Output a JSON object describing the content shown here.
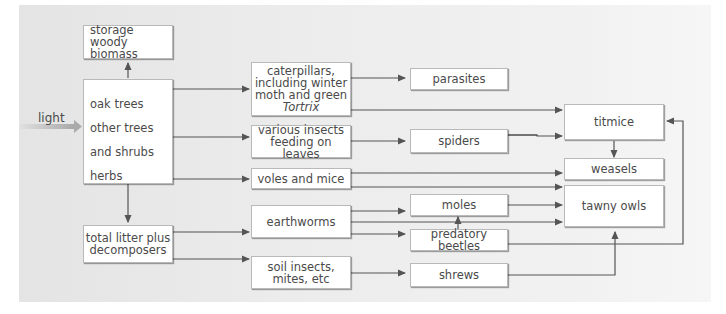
{
  "diagram": {
    "type": "food web flow diagram",
    "input_label": "light",
    "nodes": {
      "storage": [
        "storage",
        "woody biomass"
      ],
      "producers": [
        "oak trees",
        "other trees and shrubs",
        "herbs"
      ],
      "producers_line2a": "other trees",
      "producers_line2b": "and shrubs",
      "litter": [
        "total litter plus",
        "decomposers"
      ],
      "caterpillars": [
        "caterpillars,",
        "including winter",
        "moth and green",
        "Tortrix"
      ],
      "insects": [
        "various insects",
        "feeding on leaves"
      ],
      "voles": "voles and mice",
      "earthworms": "earthworms",
      "soil_insects": [
        "soil insects,",
        "mites, etc"
      ],
      "parasites": "parasites",
      "spiders": "spiders",
      "moles": "moles",
      "beetles": "predatory beetles",
      "shrews": "shrews",
      "titmice": "titmice",
      "weasels": "weasels",
      "owls": "tawny owls"
    },
    "edges": [
      [
        "producers",
        "storage"
      ],
      [
        "producers",
        "caterpillars"
      ],
      [
        "producers",
        "insects"
      ],
      [
        "producers",
        "voles"
      ],
      [
        "producers",
        "litter"
      ],
      [
        "litter",
        "earthworms"
      ],
      [
        "litter",
        "soil_insects"
      ],
      [
        "caterpillars",
        "parasites"
      ],
      [
        "caterpillars",
        "titmice"
      ],
      [
        "insects",
        "spiders"
      ],
      [
        "spiders",
        "titmice"
      ],
      [
        "voles",
        "weasels"
      ],
      [
        "voles",
        "owls"
      ],
      [
        "earthworms",
        "moles"
      ],
      [
        "earthworms",
        "beetles"
      ],
      [
        "earthworms",
        "owls"
      ],
      [
        "beetles",
        "moles"
      ],
      [
        "moles",
        "owls"
      ],
      [
        "beetles",
        "titmice"
      ],
      [
        "soil_insects",
        "shrews"
      ],
      [
        "shrews",
        "owls"
      ],
      [
        "titmice",
        "weasels"
      ]
    ],
    "colors": {
      "line": "#555555",
      "box_border": "#b9b9b9",
      "text": "#4a4a4a",
      "panel": "#ececec"
    }
  }
}
